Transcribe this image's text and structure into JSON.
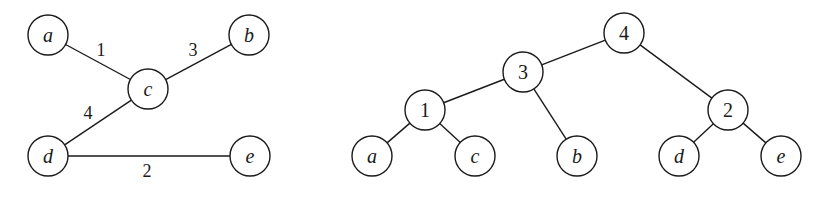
{
  "graph": {
    "node_radius": 20,
    "nodes": [
      {
        "id": "a",
        "label": "a",
        "x": 48,
        "y": 35
      },
      {
        "id": "b",
        "label": "b",
        "x": 249,
        "y": 35
      },
      {
        "id": "c",
        "label": "c",
        "x": 148,
        "y": 89
      },
      {
        "id": "d",
        "label": "d",
        "x": 48,
        "y": 156
      },
      {
        "id": "e",
        "label": "e",
        "x": 250,
        "y": 156
      }
    ],
    "edges": [
      {
        "from": "a",
        "to": "c",
        "weight": "1",
        "label_x": 101,
        "label_y": 56
      },
      {
        "from": "c",
        "to": "b",
        "weight": "3",
        "label_x": 193,
        "label_y": 56
      },
      {
        "from": "c",
        "to": "d",
        "weight": "4",
        "label_x": 88,
        "label_y": 119
      },
      {
        "from": "d",
        "to": "e",
        "weight": "2",
        "label_x": 147,
        "label_y": 177
      }
    ]
  },
  "tree": {
    "node_radius": 20,
    "nodes": [
      {
        "id": "t4",
        "label": "4",
        "x": 624,
        "y": 33,
        "kind": "internal"
      },
      {
        "id": "t3",
        "label": "3",
        "x": 523,
        "y": 72,
        "kind": "internal"
      },
      {
        "id": "t1",
        "label": "1",
        "x": 425,
        "y": 110,
        "kind": "internal"
      },
      {
        "id": "t2",
        "label": "2",
        "x": 728,
        "y": 110,
        "kind": "internal"
      },
      {
        "id": "ta",
        "label": "a",
        "x": 372,
        "y": 156,
        "kind": "leaf"
      },
      {
        "id": "tc",
        "label": "c",
        "x": 475,
        "y": 156,
        "kind": "leaf"
      },
      {
        "id": "tb",
        "label": "b",
        "x": 577,
        "y": 156,
        "kind": "leaf"
      },
      {
        "id": "td",
        "label": "d",
        "x": 679,
        "y": 156,
        "kind": "leaf"
      },
      {
        "id": "te",
        "label": "e",
        "x": 781,
        "y": 156,
        "kind": "leaf"
      }
    ],
    "edges": [
      {
        "from": "t4",
        "to": "t3"
      },
      {
        "from": "t4",
        "to": "t2"
      },
      {
        "from": "t3",
        "to": "t1"
      },
      {
        "from": "t3",
        "to": "tb"
      },
      {
        "from": "t1",
        "to": "ta"
      },
      {
        "from": "t1",
        "to": "tc"
      },
      {
        "from": "t2",
        "to": "td"
      },
      {
        "from": "t2",
        "to": "te"
      }
    ]
  }
}
